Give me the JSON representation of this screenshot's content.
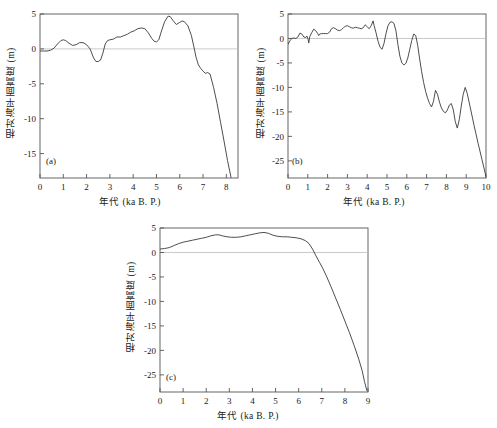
{
  "figure": {
    "background_color": "#ffffff",
    "line_color": "#3a3a3a",
    "axis_color": "#555555",
    "zero_line_color": "#bdbdbd"
  },
  "axis_titles": {
    "y": "相对海平面高度 (m)",
    "x": "年代 (ka B. P.)"
  },
  "panels": {
    "a": {
      "tag": "(a)"
    },
    "b": {
      "tag": "(b)"
    },
    "c": {
      "tag": "(c)"
    }
  },
  "chart_data": [
    {
      "type": "line",
      "panel": "(a)",
      "title": "",
      "xlabel": "年代 (ka B. P.)",
      "ylabel": "相对海平面高度 (m)",
      "xlim": [
        0,
        8.5
      ],
      "ylim": [
        -18.5,
        5
      ],
      "xticks": [
        0,
        1,
        2,
        3,
        4,
        5,
        6,
        7,
        8
      ],
      "yticks": [
        5,
        0,
        -5,
        -10,
        -15
      ],
      "xticklabels": [
        "0",
        "1",
        "2",
        "3",
        "4",
        "5",
        "6",
        "7",
        "8"
      ],
      "yticklabels": [
        "5",
        "0",
        "-5",
        "-10",
        "-15"
      ],
      "grid": false,
      "zero_reference_line": 0,
      "legend": null,
      "x": [
        0.0,
        0.15,
        0.3,
        0.45,
        0.6,
        0.75,
        0.9,
        1.0,
        1.1,
        1.25,
        1.4,
        1.55,
        1.7,
        1.85,
        2.0,
        2.15,
        2.3,
        2.4,
        2.5,
        2.6,
        2.7,
        2.8,
        2.9,
        3.0,
        3.15,
        3.3,
        3.45,
        3.6,
        3.75,
        3.9,
        4.05,
        4.2,
        4.35,
        4.5,
        4.65,
        4.8,
        4.9,
        5.0,
        5.1,
        5.2,
        5.35,
        5.5,
        5.6,
        5.7,
        5.85,
        6.0,
        6.1,
        6.2,
        6.35,
        6.5,
        6.6,
        6.7,
        6.8,
        6.9,
        7.0,
        7.1,
        7.2,
        7.3,
        7.45,
        7.6,
        7.75,
        7.9,
        8.05,
        8.2
      ],
      "y": [
        -0.3,
        -0.3,
        -0.3,
        -0.2,
        0.1,
        0.7,
        1.2,
        1.3,
        1.2,
        0.8,
        0.5,
        0.6,
        0.9,
        0.9,
        0.6,
        0.0,
        -1.3,
        -1.8,
        -1.8,
        -1.6,
        -0.6,
        0.7,
        1.2,
        1.3,
        1.4,
        1.7,
        1.7,
        1.9,
        2.1,
        2.4,
        2.6,
        2.9,
        3.0,
        2.9,
        2.3,
        1.5,
        1.1,
        1.0,
        1.3,
        2.4,
        3.9,
        4.7,
        4.6,
        4.1,
        3.5,
        3.8,
        4.0,
        3.9,
        3.3,
        1.9,
        0.4,
        -1.2,
        -2.3,
        -2.8,
        -3.2,
        -3.5,
        -3.4,
        -3.6,
        -5.5,
        -7.8,
        -10.5,
        -13.2,
        -16.0,
        -18.4
      ]
    },
    {
      "type": "line",
      "panel": "(b)",
      "title": "",
      "xlabel": "年代 (ka B. P.)",
      "ylabel": "相对海平面高度 (m)",
      "xlim": [
        0,
        10
      ],
      "ylim": [
        -28.5,
        5
      ],
      "xticks": [
        0,
        1,
        2,
        3,
        4,
        5,
        6,
        7,
        8,
        9,
        10
      ],
      "yticks": [
        5,
        0,
        -5,
        -10,
        -15,
        -20,
        -25
      ],
      "xticklabels": [
        "0",
        "1",
        "2",
        "3",
        "4",
        "5",
        "6",
        "7",
        "8",
        "9",
        "10"
      ],
      "yticklabels": [
        "5",
        "0",
        "-5",
        "-10",
        "-15",
        "-20",
        "-25"
      ],
      "grid": false,
      "zero_reference_line": 0,
      "legend": null,
      "x": [
        0.0,
        0.1,
        0.2,
        0.3,
        0.4,
        0.5,
        0.6,
        0.7,
        0.8,
        0.9,
        0.95,
        1.0,
        1.05,
        1.1,
        1.2,
        1.3,
        1.4,
        1.5,
        1.55,
        1.6,
        1.7,
        1.8,
        1.9,
        2.0,
        2.1,
        2.2,
        2.3,
        2.4,
        2.5,
        2.6,
        2.7,
        2.8,
        2.9,
        3.0,
        3.1,
        3.2,
        3.3,
        3.4,
        3.5,
        3.6,
        3.7,
        3.8,
        3.9,
        4.0,
        4.1,
        4.2,
        4.3,
        4.35,
        4.45,
        4.55,
        4.65,
        4.75,
        4.85,
        4.95,
        5.05,
        5.15,
        5.25,
        5.35,
        5.45,
        5.55,
        5.65,
        5.75,
        5.85,
        5.95,
        6.05,
        6.15,
        6.25,
        6.35,
        6.45,
        6.55,
        6.65,
        6.75,
        6.85,
        6.95,
        7.05,
        7.15,
        7.25,
        7.35,
        7.45,
        7.55,
        7.65,
        7.75,
        7.85,
        7.95,
        8.05,
        8.15,
        8.25,
        8.35,
        8.45,
        8.55,
        8.65,
        8.75,
        8.85,
        8.95,
        9.05,
        9.2,
        9.4,
        9.6,
        9.8,
        10.0
      ],
      "y": [
        -1.2,
        -0.4,
        0.0,
        0.1,
        0.0,
        0.3,
        1.1,
        0.9,
        0.3,
        0.2,
        0.5,
        0.1,
        -0.9,
        0.4,
        1.2,
        1.9,
        1.6,
        1.0,
        0.6,
        0.9,
        1.0,
        1.0,
        1.0,
        1.0,
        1.3,
        2.0,
        2.2,
        2.0,
        1.7,
        1.6,
        1.8,
        2.2,
        2.5,
        2.6,
        2.4,
        2.2,
        2.1,
        2.3,
        2.2,
        2.1,
        2.0,
        2.2,
        2.8,
        2.4,
        2.0,
        2.6,
        3.6,
        2.6,
        1.1,
        -0.6,
        -1.8,
        -2.2,
        -1.0,
        1.0,
        2.6,
        3.3,
        3.4,
        3.1,
        1.6,
        -1.2,
        -3.6,
        -5.0,
        -5.4,
        -5.1,
        -4.0,
        -2.2,
        -0.4,
        0.9,
        0.6,
        -1.4,
        -4.2,
        -6.8,
        -9.0,
        -10.8,
        -12.2,
        -13.3,
        -14.0,
        -12.8,
        -10.6,
        -11.4,
        -13.0,
        -14.2,
        -14.9,
        -15.2,
        -14.6,
        -13.6,
        -13.3,
        -14.6,
        -17.0,
        -18.3,
        -16.6,
        -13.8,
        -11.4,
        -10.0,
        -11.2,
        -14.0,
        -17.8,
        -21.4,
        -24.8,
        -28.2
      ]
    },
    {
      "type": "line",
      "panel": "(c)",
      "title": "",
      "xlabel": "年代 (ka B. P.)",
      "ylabel": "相对海平面高度 (m)",
      "xlim": [
        0,
        9
      ],
      "ylim": [
        -28.5,
        5
      ],
      "xticks": [
        0,
        1,
        2,
        3,
        4,
        5,
        6,
        7,
        8,
        9
      ],
      "yticks": [
        5,
        0,
        -5,
        -10,
        -15,
        -20,
        -25
      ],
      "xticklabels": [
        "0",
        "1",
        "2",
        "3",
        "4",
        "5",
        "6",
        "7",
        "8",
        "9"
      ],
      "yticklabels": [
        "5",
        "0",
        "-5",
        "-10",
        "-15",
        "-20",
        "-25"
      ],
      "grid": false,
      "zero_reference_line": 0,
      "legend": null,
      "x": [
        0.0,
        0.2,
        0.4,
        0.6,
        0.8,
        1.0,
        1.2,
        1.4,
        1.6,
        1.8,
        2.0,
        2.2,
        2.4,
        2.55,
        2.7,
        2.9,
        3.1,
        3.3,
        3.5,
        3.7,
        3.9,
        4.1,
        4.3,
        4.5,
        4.7,
        4.9,
        5.1,
        5.3,
        5.5,
        5.7,
        5.9,
        6.1,
        6.3,
        6.45,
        6.6,
        6.75,
        6.9,
        7.05,
        7.2,
        7.4,
        7.6,
        7.8,
        8.0,
        8.2,
        8.4,
        8.6,
        8.75,
        8.85,
        8.95
      ],
      "y": [
        0.7,
        0.8,
        1.0,
        1.4,
        1.8,
        2.1,
        2.3,
        2.5,
        2.7,
        2.9,
        3.1,
        3.4,
        3.6,
        3.6,
        3.4,
        3.2,
        3.1,
        3.1,
        3.2,
        3.4,
        3.6,
        3.8,
        4.0,
        4.1,
        3.9,
        3.5,
        3.3,
        3.2,
        3.2,
        3.1,
        3.0,
        2.8,
        2.4,
        1.8,
        0.7,
        -0.7,
        -2.0,
        -3.3,
        -4.8,
        -7.0,
        -9.3,
        -11.6,
        -14.0,
        -16.4,
        -19.0,
        -21.8,
        -24.2,
        -26.4,
        -28.2
      ]
    }
  ]
}
